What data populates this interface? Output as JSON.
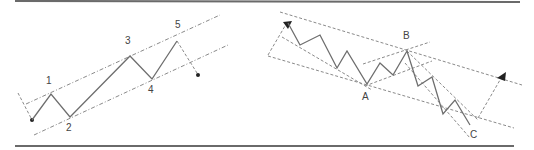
{
  "figure": {
    "left_panel": {
      "title": "Five-wave impulse in a channel",
      "wave_labels": [
        "1",
        "2",
        "3",
        "4",
        "5"
      ]
    },
    "right_panel": {
      "title": "ABC corrective pattern in a channel",
      "wave_labels": [
        "A",
        "B",
        "C"
      ]
    },
    "colors": {
      "line": "#6e6e6e",
      "guide": "#8a8a8a",
      "marker": "#222222",
      "rule": "#6a6a6a"
    }
  }
}
